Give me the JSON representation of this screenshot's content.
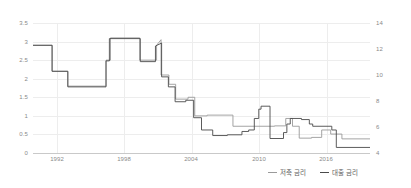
{
  "chart_data": {
    "type": "line",
    "title": "",
    "subtitle": "",
    "xlabel": "",
    "ylabel": "",
    "grid": true,
    "legend_position": "bottom-right",
    "x": [
      1990,
      1991,
      1991.5,
      1992,
      1993,
      1994,
      1995,
      1995.5,
      1996,
      1996.5,
      1997,
      1997.5,
      1998,
      1998.3,
      1998.6,
      1999,
      1999.5,
      2000,
      2000.5,
      2001,
      2001.5,
      2002,
      2003,
      2004,
      2005,
      2006,
      2007,
      2007.5,
      2008,
      2008.5,
      2008.8,
      2009,
      2010,
      2010.5,
      2011,
      2011.5,
      2012,
      2012.5,
      2013,
      2014,
      2015,
      2016,
      2016.5,
      2017,
      2018,
      2019
    ],
    "axes": {
      "left": {
        "label": "",
        "ticks": [
          "3.5",
          "3",
          "2.5",
          "2",
          "1.5",
          "1",
          "0.5",
          "0"
        ],
        "values": [
          3.5,
          3,
          2.5,
          2,
          1.5,
          1,
          0.5,
          0
        ],
        "min": 0,
        "max": 3.5
      },
      "right": {
        "label": "",
        "ticks": [
          "14",
          "12",
          "10",
          "8",
          "6",
          "4"
        ],
        "values": [
          14,
          12,
          10,
          8,
          6,
          4
        ],
        "min": 3,
        "max": 15
      },
      "x": {
        "ticks": [
          "1992",
          "1998",
          "2004",
          "2010",
          "2016"
        ],
        "values": [
          1992,
          1998,
          2004,
          2010,
          2016
        ],
        "min": 1989.5,
        "max": 2019.5
      }
    },
    "series": [
      {
        "name": "저축 금리",
        "axis": "left",
        "color": "#9a9a9a",
        "points": [
          [
            1989.5,
            2.9
          ],
          [
            1991.2,
            2.9
          ],
          [
            1991.2,
            2.2
          ],
          [
            1992.6,
            2.2
          ],
          [
            1992.6,
            1.8
          ],
          [
            1996.0,
            1.8
          ],
          [
            1996.0,
            2.5
          ],
          [
            1996.4,
            2.5
          ],
          [
            1996.4,
            3.1
          ],
          [
            1999.0,
            3.1
          ],
          [
            1999.0,
            2.5
          ],
          [
            2000.5,
            2.5
          ],
          [
            2000.5,
            2.9
          ],
          [
            2000.9,
            3.05
          ],
          [
            2000.9,
            2.1
          ],
          [
            2001.6,
            2.1
          ],
          [
            2001.6,
            1.85
          ],
          [
            2002.2,
            1.85
          ],
          [
            2002.2,
            1.45
          ],
          [
            2003.3,
            1.45
          ],
          [
            2003.3,
            1.5
          ],
          [
            2003.9,
            1.5
          ],
          [
            2003.9,
            1.0
          ],
          [
            2005.0,
            1.0
          ],
          [
            2005.0,
            1.02
          ],
          [
            2007.3,
            1.02
          ],
          [
            2007.3,
            0.72
          ],
          [
            2011.0,
            0.72
          ],
          [
            2011.0,
            0.73
          ],
          [
            2012.0,
            0.73
          ],
          [
            2012.0,
            0.93
          ],
          [
            2012.6,
            0.93
          ],
          [
            2012.6,
            0.72
          ],
          [
            2013.2,
            0.72
          ],
          [
            2013.2,
            0.4
          ],
          [
            2014.3,
            0.4
          ],
          [
            2014.3,
            0.42
          ],
          [
            2015.2,
            0.42
          ],
          [
            2015.2,
            0.62
          ],
          [
            2016.0,
            0.62
          ],
          [
            2016.0,
            0.51
          ],
          [
            2017.0,
            0.51
          ],
          [
            2017.0,
            0.38
          ],
          [
            2019.5,
            0.38
          ]
        ]
      },
      {
        "name": "대출 금리",
        "axis": "right",
        "color": "#4a4a4a",
        "points": [
          [
            1989.5,
            2.9
          ],
          [
            1991.2,
            2.9
          ],
          [
            1991.2,
            2.2
          ],
          [
            1992.6,
            2.2
          ],
          [
            1992.6,
            1.78
          ],
          [
            1996.0,
            1.78
          ],
          [
            1996.0,
            2.48
          ],
          [
            1996.3,
            2.48
          ],
          [
            1996.3,
            3.08
          ],
          [
            1999.05,
            3.08
          ],
          [
            1999.05,
            2.46
          ],
          [
            2000.4,
            2.46
          ],
          [
            2000.4,
            2.88
          ],
          [
            2000.95,
            2.96
          ],
          [
            2000.95,
            2.05
          ],
          [
            2001.55,
            2.05
          ],
          [
            2001.55,
            1.78
          ],
          [
            2002.15,
            1.78
          ],
          [
            2002.15,
            1.38
          ],
          [
            2003.1,
            1.38
          ],
          [
            2003.1,
            1.42
          ],
          [
            2003.8,
            1.42
          ],
          [
            2003.8,
            0.95
          ],
          [
            2004.5,
            0.95
          ],
          [
            2004.5,
            0.62
          ],
          [
            2005.5,
            0.62
          ],
          [
            2005.5,
            0.47
          ],
          [
            2006.8,
            0.47
          ],
          [
            2006.8,
            0.49
          ],
          [
            2008.1,
            0.49
          ],
          [
            2008.1,
            0.58
          ],
          [
            2008.7,
            0.58
          ],
          [
            2008.7,
            0.62
          ],
          [
            2009.2,
            0.62
          ],
          [
            2009.2,
            0.93
          ],
          [
            2009.6,
            0.93
          ],
          [
            2009.6,
            1.18
          ],
          [
            2009.8,
            1.18
          ],
          [
            2009.8,
            1.26
          ],
          [
            2010.6,
            1.26
          ],
          [
            2010.6,
            0.39
          ],
          [
            2011.8,
            0.39
          ],
          [
            2011.8,
            0.55
          ],
          [
            2012.1,
            0.55
          ],
          [
            2012.1,
            0.78
          ],
          [
            2012.4,
            0.78
          ],
          [
            2012.4,
            0.93
          ],
          [
            2013.4,
            0.93
          ],
          [
            2013.4,
            0.9
          ],
          [
            2014.1,
            0.9
          ],
          [
            2014.1,
            0.78
          ],
          [
            2014.4,
            0.78
          ],
          [
            2014.4,
            0.72
          ],
          [
            2016.1,
            0.72
          ],
          [
            2016.1,
            0.62
          ],
          [
            2016.5,
            0.62
          ],
          [
            2016.5,
            0.15
          ],
          [
            2019.5,
            0.15
          ]
        ]
      }
    ]
  },
  "legend": {
    "items": [
      {
        "label": "저축 금리",
        "color": "#9a9a9a"
      },
      {
        "label": "대출 금리",
        "color": "#4a4a4a"
      }
    ]
  }
}
